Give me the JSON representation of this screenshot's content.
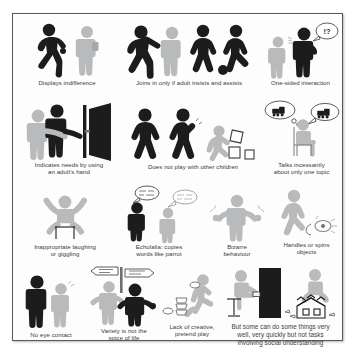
{
  "poster": {
    "title": "Autism behaviour illustration chart",
    "border_color": "#58595b",
    "background_color": "#fdfdfd",
    "ink_dark": "#1c1c1c",
    "ink_mid": "#6f7072",
    "ink_light": "#b9babc"
  },
  "panels": [
    {
      "id": "displays-indifference",
      "caption": "Displays indifference",
      "icon": "two-figures-walking-away-icon"
    },
    {
      "id": "joins-in-only-if-adult-insists",
      "caption": "Joins in only if adult insists and assists",
      "icon": "adult-pushing-child-toward-ball-game-icon"
    },
    {
      "id": "one-sided-interaction",
      "caption": "One-sided interaction",
      "icon": "figure-talking-with-exclamation-question-bubble-icon"
    },
    {
      "id": "indicates-needs-using-adults-hand",
      "caption": "Indicates needs by using\nan adult's hand",
      "icon": "child-leading-adult-hand-to-door-icon"
    },
    {
      "id": "does-not-play-with-other-children",
      "caption": "Does not play with other children",
      "icon": "two-running-figures-and-child-with-blocks-icon"
    },
    {
      "id": "talks-incessantly-about-one-topic",
      "caption": "Talks incessantly\nabout only one topic",
      "icon": "seated-figure-with-train-thought-and-speech-bubbles-icon"
    },
    {
      "id": "inappropriate-laughing-or-giggling",
      "caption": "Inappropriate laughing\nor giggling",
      "icon": "seated-figure-arms-raised-laughing-icon"
    },
    {
      "id": "echolalia-copies-words-like-parrot",
      "caption": "Echolalia: copies\nwords like parrot",
      "icon": "two-figures-mirrored-speech-bubbles-icon"
    },
    {
      "id": "bizarre-behaviour",
      "caption": "Bizarre\nbehaviour",
      "icon": "figure-with-flapping-hands-icon"
    },
    {
      "id": "handles-or-spins-objects",
      "caption": "Handles or spins\nobjects",
      "icon": "figure-spinning-object-icon"
    },
    {
      "id": "no-eye-contact",
      "caption": "No eye contact",
      "icon": "two-figures-avoiding-gaze-icon"
    },
    {
      "id": "variety-is-not-the-spice-of-life",
      "caption": "Variety is not the\nspice of life",
      "icon": "figures-at-signpost-icon"
    },
    {
      "id": "lack-of-creative-pretend-play",
      "caption": "Lack of creative,\npretend play",
      "icon": "child-stacking-cups-icon"
    },
    {
      "id": "savant-abilities",
      "caption": "But some can do some things very\nwell, very quickly but not tasks\ninvolving social understanding",
      "icon": "piano-player-and-card-house-builder-icon"
    }
  ],
  "bubbles": {
    "one_sided": "!?",
    "signpost_left": "",
    "signpost_right": ""
  }
}
